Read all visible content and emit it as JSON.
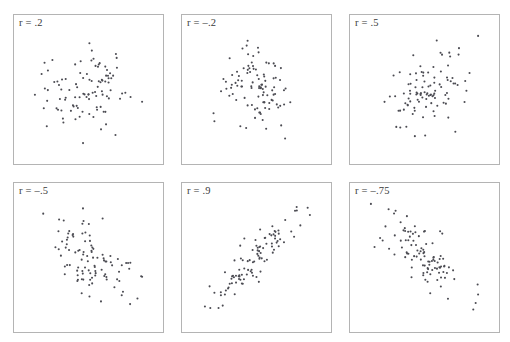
{
  "figure": {
    "background_color": "#ffffff",
    "panel_border_color": "#b4b4b4",
    "dot_color": "#4b4b52",
    "label_color": "#3a3a3a",
    "rows": 2,
    "columns": 3,
    "panel_width": 151,
    "panel_height": 151
  },
  "chart_data": {
    "type": "scatter",
    "title": "",
    "xlabel": "",
    "ylabel": "",
    "xlim": [
      -3,
      3
    ],
    "ylim": [
      -3,
      3
    ],
    "grid": false,
    "legend": "none",
    "axis_ticks": "none",
    "points_per_panel": 100,
    "marker": {
      "shape": "circle",
      "size_px": 2.1,
      "color": "#4b4b52"
    },
    "panels": [
      {
        "id": "panel-r-0.2",
        "label": "r = .2",
        "r": 0.2,
        "row": 0,
        "col": 0,
        "x_px": 13,
        "y_px": 14,
        "seed": 1207,
        "n": 100
      },
      {
        "id": "panel-r-neg0.2",
        "label": "r = –.2",
        "r": -0.2,
        "row": 0,
        "col": 1,
        "x_px": 181,
        "y_px": 14,
        "seed": 4451,
        "n": 100
      },
      {
        "id": "panel-r-0.5",
        "label": "r = .5",
        "r": 0.5,
        "row": 0,
        "col": 2,
        "x_px": 349,
        "y_px": 14,
        "seed": 8893,
        "n": 100
      },
      {
        "id": "panel-r-neg0.5",
        "label": "r = –.5",
        "r": -0.5,
        "row": 1,
        "col": 0,
        "x_px": 13,
        "y_px": 182,
        "seed": 2617,
        "n": 100
      },
      {
        "id": "panel-r-0.9",
        "label": "r = .9",
        "r": 0.9,
        "row": 1,
        "col": 1,
        "x_px": 181,
        "y_px": 182,
        "seed": 7321,
        "n": 100
      },
      {
        "id": "panel-r-neg0.75",
        "label": "r = –.75",
        "r": -0.75,
        "row": 1,
        "col": 2,
        "x_px": 349,
        "y_px": 182,
        "seed": 5039,
        "n": 100
      }
    ]
  }
}
